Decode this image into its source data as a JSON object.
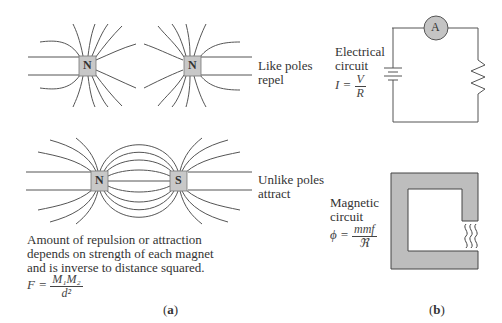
{
  "panel_a": {
    "label": "a",
    "top_pair": {
      "left_pole": "N",
      "right_pole": "N",
      "caption_line1": "Like poles",
      "caption_line2": "repel"
    },
    "bottom_pair": {
      "left_pole": "N",
      "right_pole": "S",
      "caption_line1": "Unlike poles",
      "caption_line2": "attract"
    },
    "note_line1": "Amount of repulsion or attraction",
    "note_line2": "depends on strength of each magnet",
    "note_line3": "and is inverse to distance squared.",
    "formula": {
      "lhs": "F =",
      "numerator": "M₁M₂",
      "denominator": "d²"
    }
  },
  "panel_b": {
    "label": "b",
    "electrical": {
      "title_line1": "Electrical",
      "title_line2": "circuit",
      "formula_lhs": "I =",
      "numerator": "V",
      "denominator": "R",
      "meter_label": "A"
    },
    "magnetic": {
      "title_line1": "Magnetic",
      "title_line2": "circuit",
      "formula_lhs": "ϕ =",
      "numerator": "mmf",
      "denominator": "ℜ"
    }
  },
  "colors": {
    "magnet_fill": "#c8c8c8",
    "core_fill": "#bdbdbd",
    "ammeter_fill": "#c4c4c4",
    "line": "#555555"
  }
}
